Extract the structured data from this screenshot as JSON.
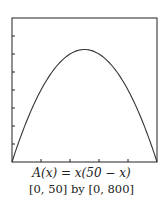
{
  "chart_data": {
    "type": "line",
    "title": "A(x) = x(50 − x)",
    "subtitle": "[0, 50] by [0, 800]",
    "xlabel": "",
    "ylabel": "",
    "xlim": [
      0,
      50
    ],
    "ylim": [
      0,
      800
    ],
    "x_ticks": [
      0,
      10,
      20,
      30,
      40,
      50
    ],
    "y_ticks": [
      0,
      100,
      200,
      300,
      400,
      500,
      600,
      700,
      800
    ],
    "grid": false,
    "series": [
      {
        "name": "A(x) = x(50 - x)",
        "x": [
          0,
          5,
          10,
          15,
          20,
          25,
          30,
          35,
          40,
          45,
          50
        ],
        "values": [
          0,
          225,
          400,
          525,
          600,
          625,
          600,
          525,
          400,
          225,
          0
        ]
      }
    ],
    "colors": {
      "line": "#333333",
      "axis": "#222222"
    }
  },
  "caption": {
    "formula": "A(x) = x(50 − x)",
    "window": "[0, 50] by [0, 800]"
  }
}
